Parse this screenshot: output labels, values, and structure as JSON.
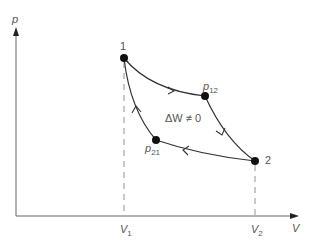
{
  "axes": {
    "y_label": "p",
    "x_label": "V"
  },
  "ticks": {
    "v1": "V",
    "v1_sub": "1",
    "v2": "V",
    "v2_sub": "2"
  },
  "points": {
    "p1": {
      "label": "1"
    },
    "p2": {
      "label": "2"
    },
    "p12": {
      "label": "p",
      "sub": "12"
    },
    "p21": {
      "label": "p",
      "sub": "21"
    }
  },
  "annotation": "ΔW ≠ 0",
  "colors": {
    "line": "#333333",
    "axis": "#555555",
    "text": "#555555"
  }
}
